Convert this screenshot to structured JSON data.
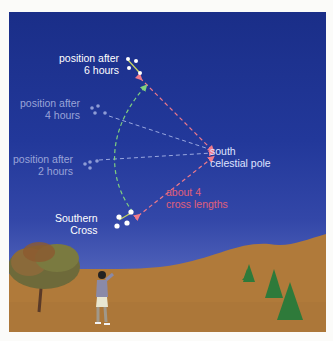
{
  "labels": {
    "pos6": [
      "position after",
      "6 hours"
    ],
    "pos4": [
      "position after",
      "4 hours"
    ],
    "pos2": [
      "position after",
      "2 hours"
    ],
    "southern_cross": [
      "Southern",
      "Cross"
    ],
    "pole": [
      "south",
      "celestial pole"
    ],
    "distance": [
      "about 4",
      "cross lengths"
    ]
  },
  "colors": {
    "sky_top": "#1a2e88",
    "sky_bottom": "#5a6bbf",
    "ground": "#b07a3a",
    "label_bright": "#ffffff",
    "label_faded": "#9aa4d8",
    "pole_label": "#dfe3ff",
    "distance_label": "#e0607a",
    "pointer_line": "#f07a8a",
    "arc_line": "#7fcf7f",
    "star_line": "#9aa8e0"
  }
}
